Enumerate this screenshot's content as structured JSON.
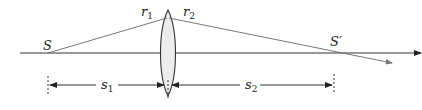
{
  "diagram": {
    "labels": {
      "source": "S",
      "image": "S′",
      "radius1": "r",
      "radius1_sub": "1",
      "radius2": "r",
      "radius2_sub": "2",
      "object_distance": "s",
      "object_distance_sub": "1",
      "image_distance": "s",
      "image_distance_sub": "2"
    },
    "colors": {
      "line": "#333333",
      "lens_fill": "#ececec",
      "ray": "#666666"
    }
  }
}
